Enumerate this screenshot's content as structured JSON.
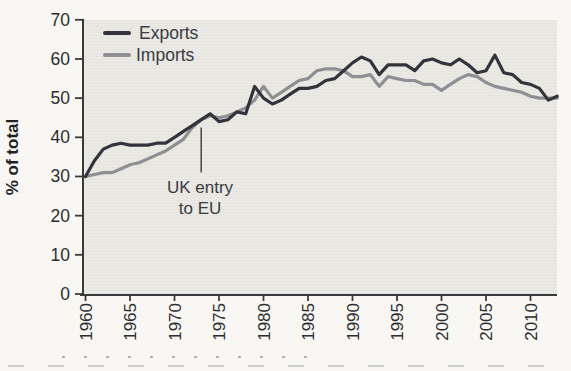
{
  "page": {
    "background": "#f8f7f3"
  },
  "legend": {
    "items": [
      {
        "label": "Exports",
        "color": "#33333b"
      },
      {
        "label": "Imports",
        "color": "#8f8e93"
      }
    ]
  },
  "chart_data": {
    "type": "line",
    "title": "",
    "xlabel": "",
    "ylabel": "% of total",
    "xlim": [
      1960,
      2013
    ],
    "ylim": [
      0,
      70
    ],
    "xticks": [
      1960,
      1965,
      1970,
      1975,
      1980,
      1985,
      1990,
      1995,
      2000,
      2005,
      2010
    ],
    "yticks": [
      0,
      10,
      20,
      30,
      40,
      50,
      60,
      70
    ],
    "grid": false,
    "legend_position": "top-left",
    "plot_bg": "#eae9e4",
    "axis_color": "#3a3a3a",
    "x_start": 1960,
    "x_step": 1,
    "series": [
      {
        "name": "Imports",
        "color": "#8f8e93",
        "values": [
          30,
          30.5,
          31,
          31,
          32,
          33,
          33.5,
          34.5,
          35.5,
          36.5,
          38,
          39.5,
          42.5,
          44.5,
          45.5,
          45,
          45.5,
          46.5,
          47.5,
          49.5,
          53,
          50,
          51.5,
          53,
          54.5,
          55,
          57,
          57.5,
          57.5,
          57,
          55.5,
          55.5,
          56,
          53,
          55.5,
          55,
          54.5,
          54.5,
          53.5,
          53.5,
          52,
          53.5,
          55,
          56,
          55.5,
          54,
          53,
          52.5,
          52,
          51.5,
          50.5,
          50,
          50,
          50
        ]
      },
      {
        "name": "Exports",
        "color": "#33333b",
        "values": [
          30,
          34,
          37,
          38,
          38.5,
          38,
          38,
          38,
          38.5,
          38.5,
          40,
          41.5,
          43,
          44.5,
          46,
          44,
          44.5,
          46.5,
          46,
          53,
          50,
          48.5,
          49.5,
          51,
          52.5,
          52.5,
          53,
          54.5,
          55,
          57,
          59,
          60.5,
          59.5,
          56,
          58.5,
          58.5,
          58.5,
          57,
          59.5,
          60,
          59,
          58.5,
          60,
          58.5,
          56.5,
          57,
          61,
          56.5,
          56,
          54,
          53.5,
          52.5,
          49.5,
          50.5
        ]
      }
    ],
    "annotation": {
      "text_line1": "UK entry",
      "text_line2": "to EU",
      "x": 1973,
      "y_top": 42.5,
      "y_bottom": 31
    }
  }
}
